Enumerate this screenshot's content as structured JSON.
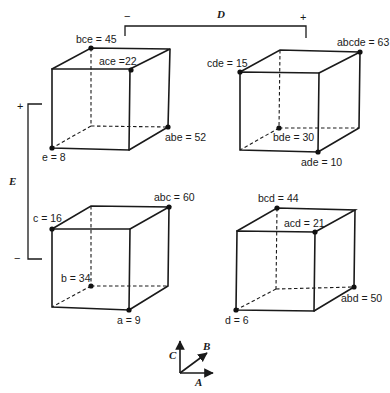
{
  "figure": {
    "factor_D": {
      "label": "D",
      "low": "−",
      "high": "+"
    },
    "factor_E": {
      "label": "E",
      "low": "−",
      "high": "+"
    },
    "axes_key": {
      "a_label": "A",
      "b_label": "B",
      "c_label": "C"
    },
    "cubes": [
      {
        "id": "D-low-E-high",
        "points": [
          {
            "name": "bce",
            "value": "45",
            "text": "bce = 45"
          },
          {
            "name": "ace",
            "value": "22",
            "text": "ace =22"
          },
          {
            "name": "abe",
            "value": "52",
            "text": "abe = 52"
          },
          {
            "name": "e",
            "value": "8",
            "text": "e = 8"
          }
        ]
      },
      {
        "id": "D-high-E-high",
        "points": [
          {
            "name": "cde",
            "value": "15",
            "text": "cde = 15"
          },
          {
            "name": "abcde",
            "value": "63",
            "text": "abcde = 63"
          },
          {
            "name": "bde",
            "value": "30",
            "text": "bde = 30"
          },
          {
            "name": "ade",
            "value": "10",
            "text": "ade = 10"
          }
        ]
      },
      {
        "id": "D-low-E-low",
        "points": [
          {
            "name": "c",
            "value": "16",
            "text": "c = 16"
          },
          {
            "name": "abc",
            "value": "60",
            "text": "abc = 60"
          },
          {
            "name": "b",
            "value": "34",
            "text": "b = 34"
          },
          {
            "name": "a",
            "value": "9",
            "text": "a = 9"
          }
        ]
      },
      {
        "id": "D-high-E-low",
        "points": [
          {
            "name": "bcd",
            "value": "44",
            "text": "bcd = 44"
          },
          {
            "name": "acd",
            "value": "21",
            "text": "acd = 21"
          },
          {
            "name": "abd",
            "value": "50",
            "text": "abd = 50"
          },
          {
            "name": "d",
            "value": "6",
            "text": "d = 6"
          }
        ]
      }
    ]
  }
}
